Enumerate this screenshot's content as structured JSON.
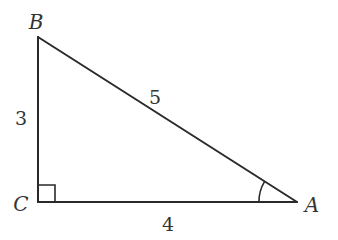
{
  "diagram": {
    "type": "right-triangle",
    "vertices": [
      {
        "id": "B",
        "label": "B",
        "x": 38,
        "y": 37
      },
      {
        "id": "C",
        "label": "C",
        "x": 38,
        "y": 202
      },
      {
        "id": "A",
        "label": "A",
        "x": 297,
        "y": 202
      }
    ],
    "sides": [
      {
        "id": "BC",
        "label": "3",
        "from": "B",
        "to": "C"
      },
      {
        "id": "BA",
        "label": "5",
        "from": "B",
        "to": "A"
      },
      {
        "id": "CA",
        "label": "4",
        "from": "C",
        "to": "A"
      }
    ],
    "right_angle_at": "C",
    "marked_angle_at": "A",
    "colors": {
      "stroke": "#2a2a2a",
      "text": "#333333",
      "background": "#ffffff"
    }
  }
}
